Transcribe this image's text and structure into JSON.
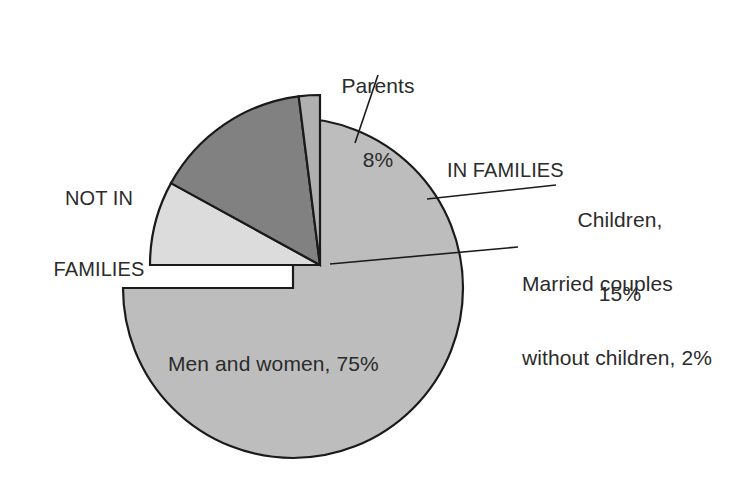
{
  "chart_data": {
    "type": "pie",
    "title": "",
    "subtitle": "",
    "xlabel": "",
    "ylabel": "",
    "legend_position": "none",
    "grid": false,
    "total": 100,
    "units": "%",
    "groups": [
      {
        "name": "NOT IN FAMILIES",
        "value": 75,
        "exploded": false,
        "slice_indices": [
          0
        ]
      },
      {
        "name": "IN FAMILIES",
        "value": 25,
        "exploded": true,
        "slice_indices": [
          1,
          2,
          3
        ]
      }
    ],
    "categories": [
      "Men and women",
      "Parents",
      "Children",
      "Married couples without children"
    ],
    "values": [
      75,
      8,
      15,
      2
    ],
    "colors": [
      "#bdbdbd",
      "#dcdcdc",
      "#818181",
      "#b0b0b0"
    ],
    "slices": [
      {
        "label": "Men and women, 75%",
        "category": "Men and women",
        "value": 75,
        "percent": "75%",
        "color": "#bdbdbd",
        "group": "NOT IN FAMILIES",
        "start_angle_deg": 0,
        "end_angle_deg": 270
      },
      {
        "label": "Parents 8%",
        "category": "Parents",
        "value": 8,
        "percent": "8%",
        "color": "#dcdcdc",
        "group": "IN FAMILIES",
        "start_angle_deg": 270,
        "end_angle_deg": 298.8
      },
      {
        "label": "Children, 15%",
        "category": "Children",
        "value": 15,
        "percent": "15%",
        "color": "#818181",
        "group": "IN FAMILIES",
        "start_angle_deg": 298.8,
        "end_angle_deg": 352.8
      },
      {
        "label": "Married couples without children, 2%",
        "category": "Married couples without children",
        "value": 2,
        "percent": "2%",
        "color": "#b0b0b0",
        "group": "IN FAMILIES",
        "start_angle_deg": 352.8,
        "end_angle_deg": 360
      }
    ]
  },
  "labels": {
    "parents": {
      "line1": "Parents",
      "line2": "8%"
    },
    "in_families": {
      "text": "IN FAMILIES"
    },
    "children": {
      "line1": "Children,",
      "line2": "15%"
    },
    "married_couples": {
      "line1": "Married couples",
      "line2": "without children, 2%"
    },
    "not_in_families": {
      "line1": "NOT IN",
      "line2": "FAMILIES"
    },
    "men_and_women": {
      "text": "Men and women, 75%"
    }
  },
  "style": {
    "background": "#ffffff",
    "outline": "#1a1a1a",
    "text_color": "#2b2b2b",
    "slice_not_in_families": "#bdbdbd",
    "slice_parents": "#dcdcdc",
    "slice_children": "#818181",
    "slice_married": "#b0b0b0"
  }
}
